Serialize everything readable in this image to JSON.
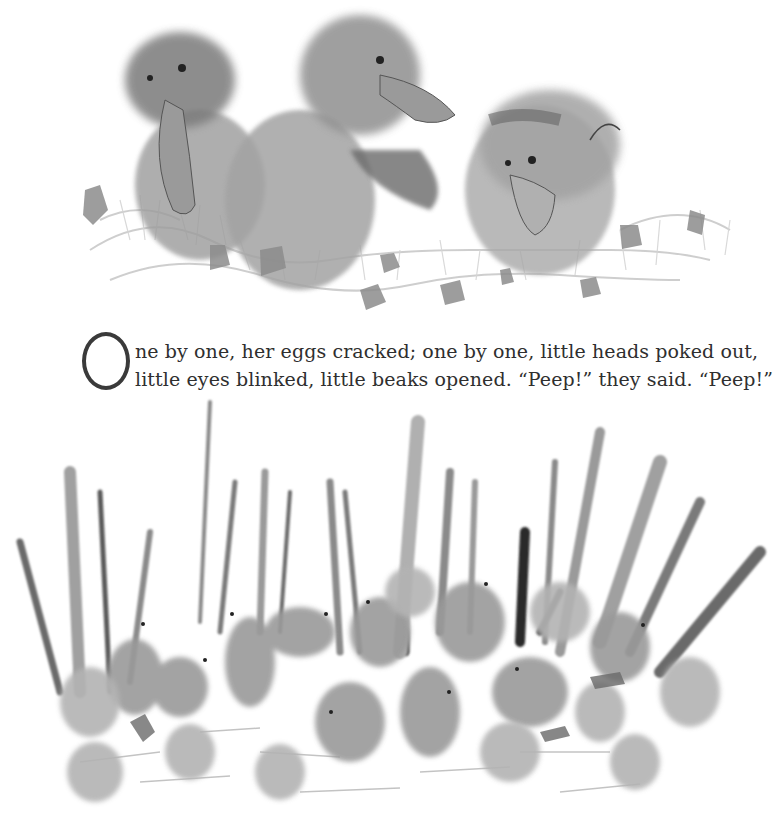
{
  "page": {
    "type": "picture-book-page",
    "illustrations": [
      {
        "id": "top",
        "description": "Three ducklings hatching from large eggs amid feathery grass and broken shell pieces, grayscale watercolor"
      },
      {
        "id": "bottom",
        "description": "Many ducklings among cracked eggshells in front of tall reeds and grass, grayscale watercolor"
      }
    ],
    "text": {
      "drop_cap": "O",
      "line1": "ne by one, her eggs cracked; one by one, little heads poked out,",
      "line2": "little eyes blinked, little beaks opened. “Peep!” they said. “Peep!”"
    },
    "colors": {
      "background": "#ffffff",
      "text": "#2f2f2f",
      "ink_dark": "#4a4a4a",
      "ink_mid": "#8a8a8a",
      "ink_light": "#b8b8b8"
    }
  }
}
